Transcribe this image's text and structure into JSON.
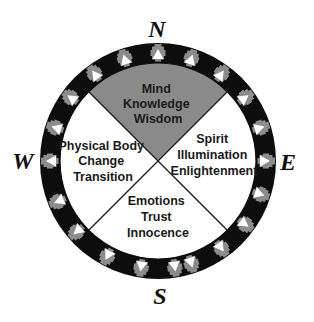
{
  "diagram": {
    "type": "medicine-wheel",
    "center": [
      158,
      161
    ],
    "ring": {
      "outer_radius": 118,
      "inner_radius": 98,
      "color": "#0d0d0d",
      "motif_count": 20,
      "motif_angles_deg": [
        0,
        18,
        36,
        54,
        72,
        81,
        99,
        118,
        139,
        158,
        180,
        198,
        216,
        234,
        252,
        270,
        288,
        306,
        324,
        342
      ],
      "motif_gray": "#8c8c8c",
      "motif_white": "#ffffff"
    },
    "divider_color": "#1a1a1a",
    "directions": {
      "north": {
        "label": "N",
        "x": 157,
        "y": 29
      },
      "south": {
        "label": "S",
        "x": 160,
        "y": 296
      },
      "east": {
        "label": "E",
        "x": 288,
        "y": 162
      },
      "west": {
        "label": "W",
        "x": 23,
        "y": 161
      }
    },
    "quadrants": {
      "north": {
        "fill": "#8a8a8a",
        "lines": [
          "Mind",
          "Knowledge",
          "Wisdom"
        ],
        "x": 158,
        "y": [
          93,
          108,
          123
        ]
      },
      "east": {
        "fill": "#ffffff",
        "lines": [
          "Spirit",
          "Illumination",
          "Enlightenment"
        ],
        "x": 214,
        "y": [
          143,
          159,
          175
        ]
      },
      "south": {
        "fill": "#ffffff",
        "lines": [
          "Emotions",
          "Trust",
          "Innocence"
        ],
        "x": 158,
        "y": [
          205,
          221,
          237
        ]
      },
      "west": {
        "fill": "#ffffff",
        "lines": [
          "Physical Body",
          "Change",
          "Transition"
        ],
        "x": 103,
        "y": [
          150,
          165,
          181
        ]
      }
    }
  }
}
